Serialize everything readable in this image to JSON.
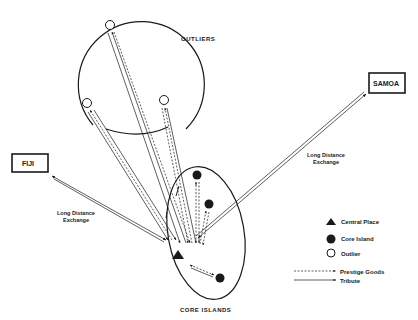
{
  "diagram": {
    "regions": {
      "outliers_label": "OUTLIERS",
      "core_islands_label": "CORE ISLANDS"
    },
    "external": {
      "fiji": "FIJI",
      "samoa": "SAMOA"
    },
    "exchange_labels": {
      "fiji_line1": "Long Distance",
      "fiji_line2": "Exchange",
      "samoa_line1": "Long Distance",
      "samoa_line2": "Exchange"
    },
    "legend": {
      "central_place": "Central Place",
      "core_island": "Core Island",
      "outlier": "Outlier",
      "prestige_goods": "Prestige Goods",
      "tribute": "Tribute"
    },
    "nodes": {
      "central_place": "triangle-icon",
      "core_islands": [
        "filled-circle-icon",
        "filled-circle-icon",
        "filled-circle-icon"
      ],
      "outliers": [
        "open-circle-icon",
        "open-circle-icon",
        "open-circle-icon"
      ]
    },
    "colors": {
      "ink": "#1a1a1a",
      "background": "#ffffff"
    }
  }
}
